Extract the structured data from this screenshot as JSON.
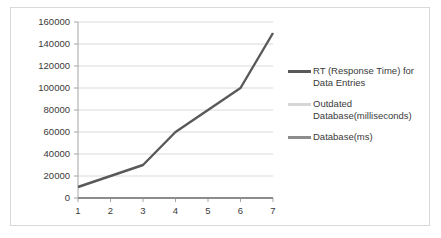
{
  "chart_data": {
    "type": "line",
    "title": "",
    "xlabel": "",
    "ylabel": "",
    "categories": [
      "1",
      "2",
      "3",
      "4",
      "5",
      "6",
      "7"
    ],
    "x": [
      1,
      2,
      3,
      4,
      5,
      6,
      7
    ],
    "ylim": [
      0,
      160000
    ],
    "xlim": [
      1,
      7
    ],
    "y_ticks": [
      "0",
      "20000",
      "40000",
      "60000",
      "80000",
      "100000",
      "120000",
      "140000",
      "160000"
    ],
    "y_tick_values": [
      0,
      20000,
      40000,
      60000,
      80000,
      100000,
      120000,
      140000,
      160000
    ],
    "x_ticks": [
      "1",
      "2",
      "3",
      "4",
      "5",
      "6",
      "7"
    ],
    "grid": "horizontal",
    "legend_position": "right",
    "series": [
      {
        "name": "RT (Response Time) for Data Entries",
        "color": "#595959",
        "values": [
          10000,
          20000,
          30000,
          60000,
          80000,
          100000,
          150000
        ]
      },
      {
        "name": "Outdated Database(milliseconds)",
        "color": "#d6d6d6",
        "values": [
          0,
          0,
          0,
          0,
          0,
          0,
          0
        ]
      },
      {
        "name": "Database(ms)",
        "color": "#8c8c8c",
        "values": [
          0,
          0,
          0,
          0,
          0,
          0,
          0
        ]
      }
    ]
  },
  "legend": {
    "items": [
      {
        "label": "RT (Response Time) for Data Entries",
        "color": "#595959"
      },
      {
        "label": "Outdated Database(milliseconds)",
        "color": "#d6d6d6"
      },
      {
        "label": "Database(ms)",
        "color": "#8c8c8c"
      }
    ]
  },
  "style": {
    "plot_background": "#ffffff",
    "grid_color": "#d9d9d9",
    "axis_color": "#a6a6a6",
    "border_color": "#d9d9d9",
    "text_color": "#3a3a3a"
  }
}
